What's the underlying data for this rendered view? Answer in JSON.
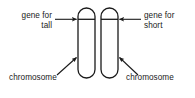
{
  "figure": {
    "background_color": "#ffffff",
    "stroke_color": "#1a1a1a",
    "text_color": "#1a1a1a",
    "width": 195,
    "height": 98
  },
  "labels": {
    "gene_tall": {
      "line1": "gene for",
      "line2": "tall",
      "arrow": "arrow-right"
    },
    "gene_short": {
      "line1": "gene for",
      "line2": "short",
      "arrow": "arrow-left"
    },
    "chromosome_left": {
      "text": "chromosome",
      "arrow": "arrow-diagonal-up-right"
    },
    "chromosome_right": {
      "text": "chromosome",
      "arrow": "arrow-diagonal-up-left"
    }
  },
  "chromosomes": [
    {
      "id": "chromosome-left",
      "name": "chromosome-left",
      "x": 78,
      "y": 8,
      "width": 17,
      "height": 70,
      "corner_radius": 8.5,
      "gene_band_y": 19
    },
    {
      "id": "chromosome-right",
      "name": "chromosome-right",
      "x": 101,
      "y": 8,
      "width": 17,
      "height": 70,
      "corner_radius": 8.5,
      "gene_band_y": 19
    }
  ],
  "connectors": [
    {
      "name": "gene-tall-arrow",
      "from": [
        55,
        19
      ],
      "to": [
        77,
        19
      ],
      "style": "straight"
    },
    {
      "name": "gene-short-arrow",
      "from": [
        141,
        19
      ],
      "to": [
        119,
        19
      ],
      "style": "straight"
    },
    {
      "name": "chromosome-left-arrow",
      "from": [
        57,
        75
      ],
      "to": [
        77,
        57
      ],
      "style": "diagonal"
    },
    {
      "name": "chromosome-right-arrow",
      "from": [
        138,
        75
      ],
      "to": [
        120,
        57
      ],
      "style": "diagonal"
    }
  ]
}
